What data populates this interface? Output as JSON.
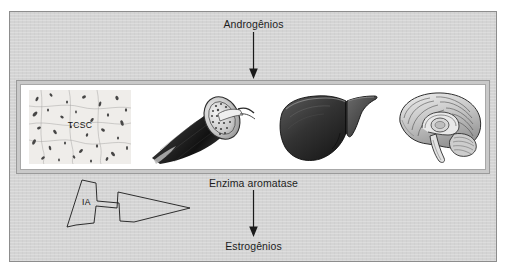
{
  "figure": {
    "title_top": "Androgênios",
    "title_middle": "Enzima aromatase",
    "title_bottom": "Estrogênios",
    "inhibitor_label": "IA",
    "tissue_label": "TCSC",
    "colors": {
      "page_background": "#ffffff",
      "panel_background": "#d4d4d4",
      "frame_border": "#8d8d8d",
      "strip_border": "#9a9a9a",
      "strip_background": "#ffffff",
      "text": "#1d1d1d",
      "arrow": "#1a1a1a"
    },
    "organs": [
      {
        "name": "subcutaneous-adipose-tissue",
        "caption": "TCSC"
      },
      {
        "name": "skeletal-muscle",
        "caption": ""
      },
      {
        "name": "liver",
        "caption": ""
      },
      {
        "name": "brain",
        "caption": ""
      }
    ],
    "arrows": [
      {
        "name": "androgens-to-tissues",
        "direction": "down"
      },
      {
        "name": "aromatase-to-estrogens",
        "direction": "down"
      },
      {
        "name": "aromatase-inhibitor",
        "direction": "right",
        "label": "IA"
      }
    ]
  }
}
